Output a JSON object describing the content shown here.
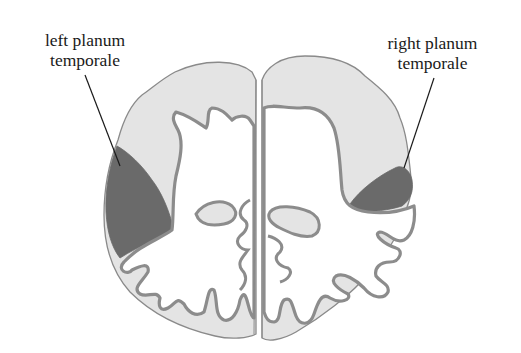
{
  "diagram": {
    "labels": {
      "left": {
        "line1": "left planum",
        "line2": "temporale"
      },
      "right": {
        "line1": "right planum",
        "line2": "temporale"
      }
    },
    "colors": {
      "background": "#ffffff",
      "cortex_fill": "#e4e4e4",
      "planum_fill": "#6a6a6a",
      "outline": "#8a8a8a",
      "cortex_band": "#8c8c8c",
      "white_matter": "#ffffff",
      "leader_line": "#1a1a1a",
      "text": "#1a1a1a"
    },
    "regions": [
      {
        "name": "left-hemisphere",
        "planum": "large"
      },
      {
        "name": "right-hemisphere",
        "planum": "small"
      }
    ]
  }
}
